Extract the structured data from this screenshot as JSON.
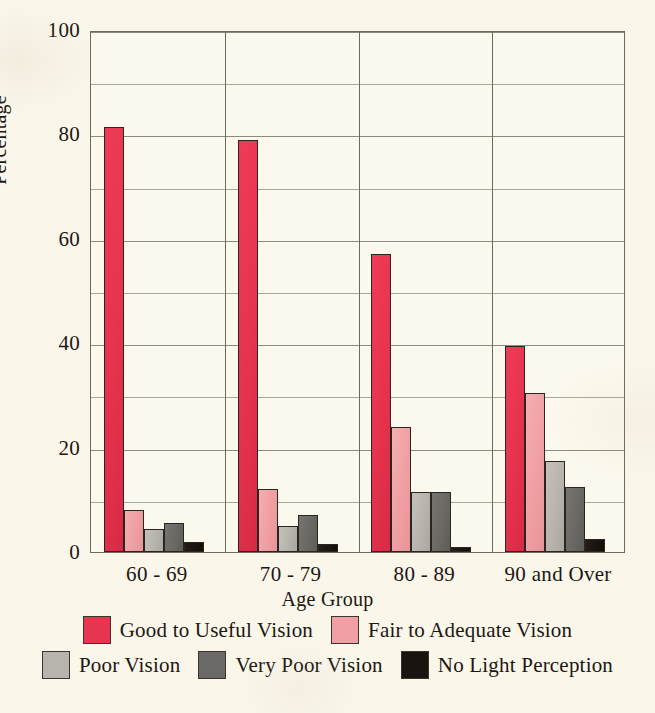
{
  "chart_data": {
    "type": "bar",
    "title": "",
    "xlabel": "Age Group",
    "ylabel": "Percentage",
    "categories": [
      "60 - 69",
      "70 - 79",
      "80 - 89",
      "90 and Over"
    ],
    "ylim": [
      0,
      100
    ],
    "y_ticks": [
      0,
      20,
      40,
      60,
      80,
      100
    ],
    "y_tick_labels": [
      "0",
      "20",
      "40",
      "60",
      "80",
      "100"
    ],
    "y_minor_ticks": [
      10,
      30,
      50,
      70,
      90
    ],
    "grid": true,
    "legend_position": "bottom",
    "series": [
      {
        "name": "Good to Useful Vision",
        "color": "#e8354f",
        "values": [
          81.5,
          79.0,
          57.0,
          39.5
        ]
      },
      {
        "name": "Fair to Adequate Vision",
        "color": "#f0a0a4",
        "values": [
          8.0,
          12.0,
          24.0,
          30.5
        ]
      },
      {
        "name": "Poor Vision",
        "color": "#b6b4ad",
        "values": [
          4.5,
          5.0,
          11.5,
          17.5
        ]
      },
      {
        "name": "Very Poor Vision",
        "color": "#6b6965",
        "values": [
          5.5,
          7.0,
          11.5,
          12.5
        ]
      },
      {
        "name": "No Light Perception",
        "color": "#1a1410",
        "values": [
          2.0,
          1.5,
          1.0,
          2.5
        ]
      }
    ]
  },
  "axes": {
    "y_title": "Percentage",
    "x_title": "Age Group"
  },
  "legend": {
    "rows": [
      [
        {
          "label": "Good to Useful Vision",
          "color": "#e8354f"
        },
        {
          "label": "Fair to Adequate Vision",
          "color": "#f0a0a4"
        }
      ],
      [
        {
          "label": "Poor Vision",
          "color": "#b6b4ad"
        },
        {
          "label": "Very Poor Vision",
          "color": "#6b6965"
        },
        {
          "label": "No Light Perception",
          "color": "#1a1410"
        }
      ]
    ]
  },
  "colors": {
    "background": "#faf6ea",
    "plot_background": "#fbf8ed",
    "axis": "#6d6a5e",
    "gridline": "#8d8a7e",
    "text": "#1c1713"
  }
}
